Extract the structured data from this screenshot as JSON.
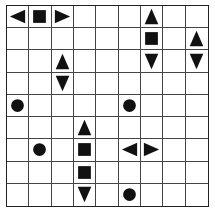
{
  "puzzle": {
    "type": "battleships",
    "rows": 9,
    "cols": 9,
    "colors": {
      "grid_line": "#444444",
      "piece": "#111111",
      "background": "#ffffff"
    },
    "pieces": [
      {
        "row": 0,
        "col": 0,
        "shape": "end-left"
      },
      {
        "row": 0,
        "col": 1,
        "shape": "middle"
      },
      {
        "row": 0,
        "col": 2,
        "shape": "end-right"
      },
      {
        "row": 0,
        "col": 6,
        "shape": "end-top"
      },
      {
        "row": 1,
        "col": 6,
        "shape": "middle"
      },
      {
        "row": 1,
        "col": 8,
        "shape": "end-top"
      },
      {
        "row": 2,
        "col": 2,
        "shape": "end-top"
      },
      {
        "row": 2,
        "col": 6,
        "shape": "end-bottom"
      },
      {
        "row": 2,
        "col": 8,
        "shape": "end-bottom"
      },
      {
        "row": 3,
        "col": 2,
        "shape": "end-bottom"
      },
      {
        "row": 4,
        "col": 0,
        "shape": "single"
      },
      {
        "row": 4,
        "col": 5,
        "shape": "single"
      },
      {
        "row": 5,
        "col": 3,
        "shape": "end-top"
      },
      {
        "row": 6,
        "col": 1,
        "shape": "single"
      },
      {
        "row": 6,
        "col": 3,
        "shape": "middle"
      },
      {
        "row": 6,
        "col": 5,
        "shape": "end-left"
      },
      {
        "row": 6,
        "col": 6,
        "shape": "end-right"
      },
      {
        "row": 7,
        "col": 3,
        "shape": "middle"
      },
      {
        "row": 8,
        "col": 3,
        "shape": "end-bottom"
      },
      {
        "row": 8,
        "col": 5,
        "shape": "single"
      }
    ]
  }
}
